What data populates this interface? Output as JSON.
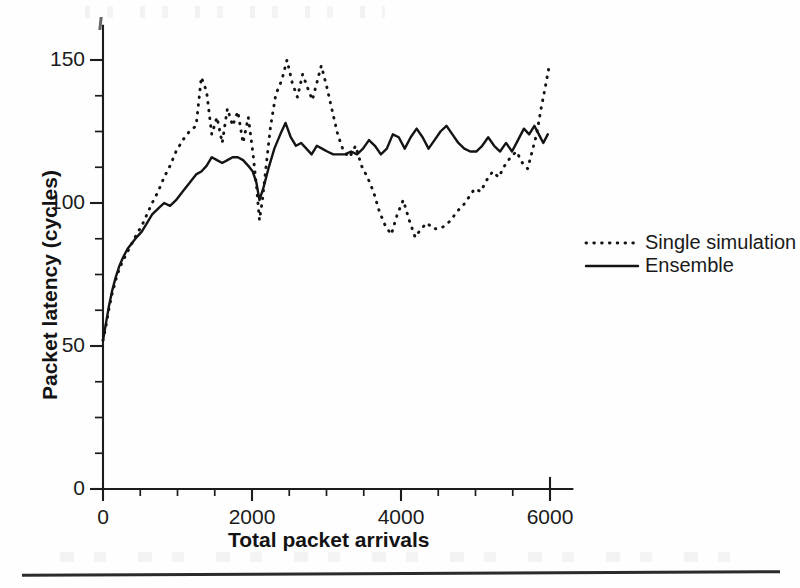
{
  "chart_data": {
    "type": "line",
    "title": "",
    "xlabel": "Total packet arrivals",
    "ylabel": "Packet latency (cycles)",
    "xlim": [
      0,
      6300
    ],
    "ylim": [
      0,
      162
    ],
    "grid": false,
    "x_ticks": [
      0,
      2000,
      4000,
      6000
    ],
    "x_tick_labels": [
      "0",
      "2000",
      "4000",
      "6000"
    ],
    "x_minor_step": 500,
    "y_ticks": [
      0,
      50,
      100,
      150
    ],
    "y_tick_labels": [
      "0",
      "50",
      "100",
      "150"
    ],
    "y_minor_step": 12.5,
    "legend_position": "right",
    "series": [
      {
        "name": "Single simulation",
        "style": "dotted",
        "color": "#141414",
        "x": [
          0,
          40,
          80,
          120,
          170,
          220,
          270,
          330,
          390,
          450,
          520,
          590,
          660,
          740,
          820,
          900,
          980,
          1070,
          1160,
          1250,
          1320,
          1390,
          1460,
          1530,
          1600,
          1670,
          1740,
          1810,
          1880,
          1950,
          2010,
          2060,
          2100,
          2140,
          2190,
          2250,
          2320,
          2400,
          2470,
          2540,
          2610,
          2680,
          2750,
          2810,
          2870,
          2930,
          3000,
          3070,
          3150,
          3230,
          3310,
          3390,
          3470,
          3550,
          3630,
          3710,
          3790,
          3870,
          3950,
          4030,
          4110,
          4190,
          4270,
          4350,
          4430,
          4510,
          4590,
          4670,
          4750,
          4830,
          4910,
          4990,
          5070,
          5150,
          5230,
          5310,
          5390,
          5470,
          5550,
          5630,
          5700,
          5760,
          5820,
          5880,
          5940,
          5990
        ],
        "y": [
          52,
          57,
          63,
          68,
          73,
          77,
          80,
          83,
          86,
          89,
          92,
          96,
          100,
          104,
          109,
          113,
          118,
          122,
          125,
          127,
          144,
          139,
          124,
          130,
          121,
          133,
          127,
          132,
          121,
          130,
          118,
          106,
          94,
          101,
          113,
          127,
          138,
          143,
          150,
          142,
          137,
          145,
          140,
          136,
          142,
          148,
          141,
          133,
          124,
          118,
          116,
          120,
          113,
          109,
          104,
          97,
          92,
          89,
          96,
          101,
          94,
          88,
          91,
          93,
          91,
          91,
          92,
          94,
          97,
          99,
          102,
          105,
          104,
          108,
          111,
          109,
          113,
          116,
          118,
          114,
          112,
          118,
          124,
          133,
          141,
          148
        ]
      },
      {
        "name": "Ensemble",
        "style": "solid",
        "color": "#141414",
        "x": [
          0,
          40,
          80,
          120,
          170,
          220,
          270,
          330,
          390,
          450,
          520,
          590,
          660,
          740,
          820,
          900,
          980,
          1070,
          1160,
          1250,
          1320,
          1390,
          1460,
          1530,
          1600,
          1670,
          1740,
          1810,
          1880,
          1950,
          2010,
          2060,
          2100,
          2150,
          2220,
          2300,
          2380,
          2450,
          2520,
          2590,
          2660,
          2730,
          2800,
          2870,
          2940,
          3010,
          3090,
          3170,
          3250,
          3330,
          3410,
          3490,
          3570,
          3650,
          3730,
          3810,
          3890,
          3970,
          4050,
          4130,
          4210,
          4290,
          4370,
          4450,
          4530,
          4610,
          4690,
          4770,
          4850,
          4930,
          5010,
          5090,
          5170,
          5250,
          5330,
          5410,
          5490,
          5570,
          5650,
          5720,
          5790,
          5850,
          5910,
          5970
        ],
        "y": [
          52,
          58,
          64,
          69,
          74,
          78,
          81,
          84,
          86,
          88,
          90,
          93,
          96,
          98,
          100,
          99,
          101,
          104,
          107,
          110,
          111,
          113,
          116,
          115,
          114,
          115,
          116,
          116,
          115,
          113,
          111,
          107,
          101,
          105,
          112,
          119,
          124,
          128,
          123,
          120,
          121,
          119,
          117,
          120,
          119,
          118,
          117,
          117,
          117,
          118,
          117,
          119,
          122,
          120,
          117,
          119,
          124,
          123,
          119,
          123,
          126,
          123,
          119,
          122,
          125,
          127,
          124,
          121,
          119,
          118,
          118,
          120,
          123,
          120,
          118,
          121,
          118,
          122,
          126,
          124,
          127,
          124,
          121,
          124
        ]
      }
    ]
  },
  "legend": {
    "items": [
      {
        "label": "Single simulation",
        "style": "dotted"
      },
      {
        "label": "Ensemble",
        "style": "solid"
      }
    ]
  }
}
